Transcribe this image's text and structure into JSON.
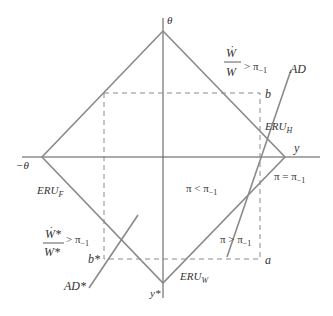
{
  "diagram": {
    "axes": {
      "vertical_label": "θ",
      "horizontal_label": "y",
      "neg_horizontal_label": "−θ",
      "bottom_label": "y*"
    },
    "curves": {
      "eru_h": {
        "name": "ERU",
        "sub": "H"
      },
      "eru_f": {
        "name": "ERU",
        "sub": "F"
      },
      "eru_w": {
        "name": "ERU",
        "sub": "W"
      },
      "ad": "AD",
      "ad_star": "AD*"
    },
    "points": {
      "b": "b",
      "b_star": "b*",
      "a": "a"
    },
    "regions": {
      "pi_less": {
        "main": "π < π",
        "sub": "−1"
      },
      "pi_greater": {
        "main": "π > π",
        "sub": "−1"
      },
      "pi_equal": {
        "main": "π = π",
        "sub": "−1"
      }
    },
    "conditions": {
      "home_wage": {
        "num": "Ẇ",
        "den": "W",
        "rel": "> π",
        "sub": "−1"
      },
      "foreign_wage": {
        "num": "Ẇ*",
        "den": "W*",
        "rel": "> π",
        "sub": "−1"
      }
    },
    "colors": {
      "line": "#8a8a8a",
      "axis": "#555555",
      "dash": "#8a8a8a",
      "text": "#333333"
    }
  }
}
